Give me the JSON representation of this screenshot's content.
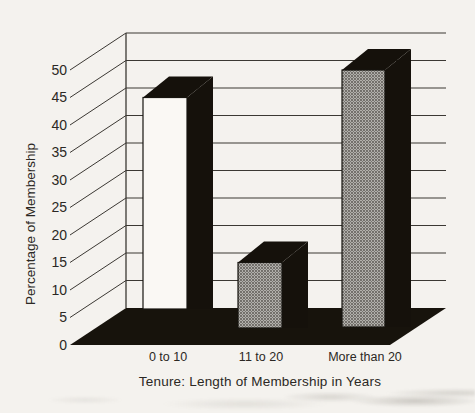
{
  "chart_data": {
    "type": "bar",
    "projection": "3d-oblique",
    "title": "",
    "xlabel": "Tenure: Length of Membership in Years",
    "ylabel": "Percentage of Membership",
    "categories": [
      "0 to 10",
      "11 to 20",
      "More than 20"
    ],
    "values": [
      45,
      15,
      50
    ],
    "ylim": [
      0,
      50
    ],
    "yticks": [
      0,
      5,
      10,
      15,
      20,
      25,
      30,
      35,
      40,
      45,
      50
    ],
    "grid": true,
    "legend": false,
    "bar_fill_styles": [
      "white",
      "halftone",
      "halftone"
    ],
    "colors": {
      "paper": "#f4f2ee",
      "ink_text": "#2b2824",
      "line": "#3b3833",
      "dark_face": "#15110b",
      "floor": "#17130c",
      "bar_white_face": "#faf8f4",
      "halftone_base": "#b2b0ac",
      "halftone_dot": "#55524d",
      "halftone_dot2": "#6b6862"
    }
  }
}
